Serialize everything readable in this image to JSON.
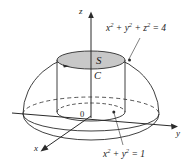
{
  "figure": {
    "background_color": "#ffffff",
    "line_color": "#2b2b2b",
    "shaded_disk_color": "#c8c8c8",
    "axes": {
      "z_label": "z",
      "y_label": "y",
      "x_label": "x",
      "origin_label": "0"
    },
    "regions": {
      "surface_label": "S",
      "curve_label": "C"
    },
    "equations": {
      "sphere": {
        "base1": "x",
        "exp1": "2",
        "plus1": " + ",
        "base2": "y",
        "exp2": "2",
        "plus2": " + ",
        "base3": "z",
        "exp3": "2",
        "equals": " = 4",
        "full": "x² + y² + z² = 4"
      },
      "cylinder": {
        "base1": "x",
        "exp1": "2",
        "plus1": " + ",
        "base2": "y",
        "exp2": "2",
        "equals": " = 1",
        "full": "x² + y² = 1"
      }
    }
  }
}
